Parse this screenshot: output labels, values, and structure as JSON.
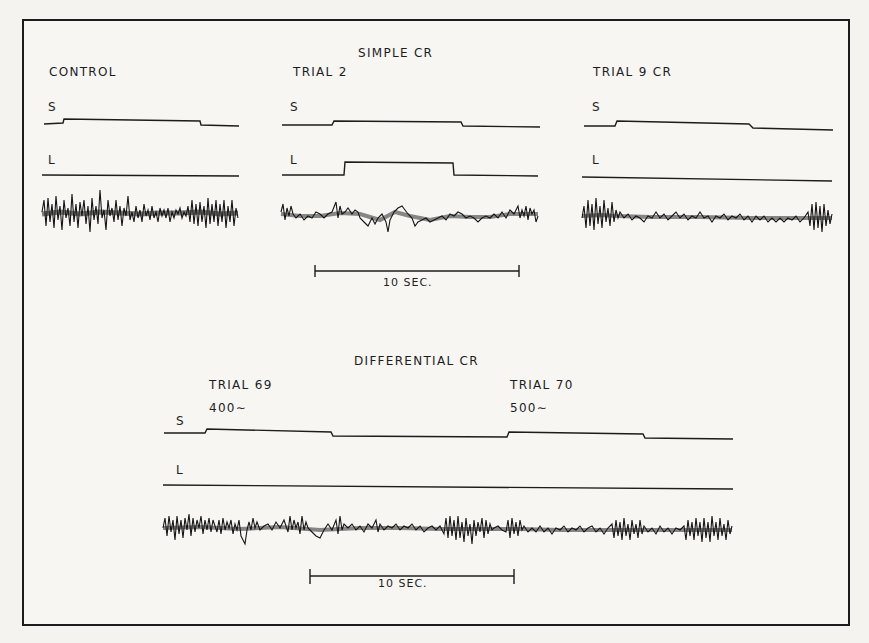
{
  "figure": {
    "sections": {
      "simple_cr": {
        "title": "SIMPLE CR",
        "panels": [
          {
            "label": "CONTROL",
            "s_label": "S",
            "l_label": "L"
          },
          {
            "label": "TRIAL 2",
            "s_label": "S",
            "l_label": "L"
          },
          {
            "label": "TRIAL 9  CR",
            "s_label": "S",
            "l_label": "L"
          }
        ],
        "scale_bar": "10 SEC."
      },
      "differential_cr": {
        "title": "DIFFERENTIAL CR",
        "trials": [
          {
            "label": "TRIAL 69",
            "stimulus": "400∼"
          },
          {
            "label": "TRIAL 70",
            "stimulus": "500∼"
          }
        ],
        "s_label": "S",
        "l_label": "L",
        "scale_bar": "10 SEC."
      }
    },
    "colors": {
      "ink": "#1c1c1c",
      "paper": "#f7f6f3"
    }
  }
}
